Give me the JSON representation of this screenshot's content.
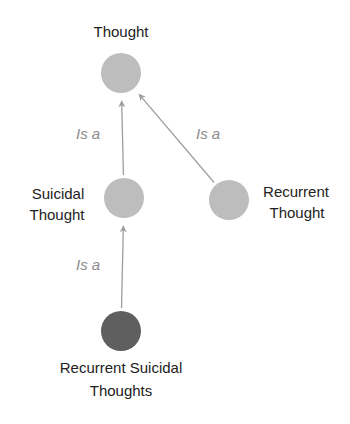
{
  "diagram": {
    "type": "concept-hierarchy",
    "colors": {
      "node_default": "#bdbdbd",
      "node_highlight": "#5f5f5f",
      "edge": "#9e9e9e",
      "edge_label": "#8a8a8a",
      "node_label": "#222222"
    },
    "nodes": [
      {
        "id": "thought",
        "label_lines": [
          "Thought"
        ],
        "highlight": false
      },
      {
        "id": "suicidal-thought",
        "label_lines": [
          "Suicidal",
          "Thought"
        ],
        "highlight": false
      },
      {
        "id": "recurrent-thought",
        "label_lines": [
          "Recurrent",
          "Thought"
        ],
        "highlight": false
      },
      {
        "id": "recurrent-suicidal-thoughts",
        "label_lines": [
          "Recurrent Suicidal",
          "Thoughts"
        ],
        "highlight": true
      }
    ],
    "edges": [
      {
        "from": "suicidal-thought",
        "to": "thought",
        "label": "Is a"
      },
      {
        "from": "recurrent-thought",
        "to": "thought",
        "label": "Is a"
      },
      {
        "from": "recurrent-suicidal-thoughts",
        "to": "suicidal-thought",
        "label": "Is a"
      }
    ]
  }
}
